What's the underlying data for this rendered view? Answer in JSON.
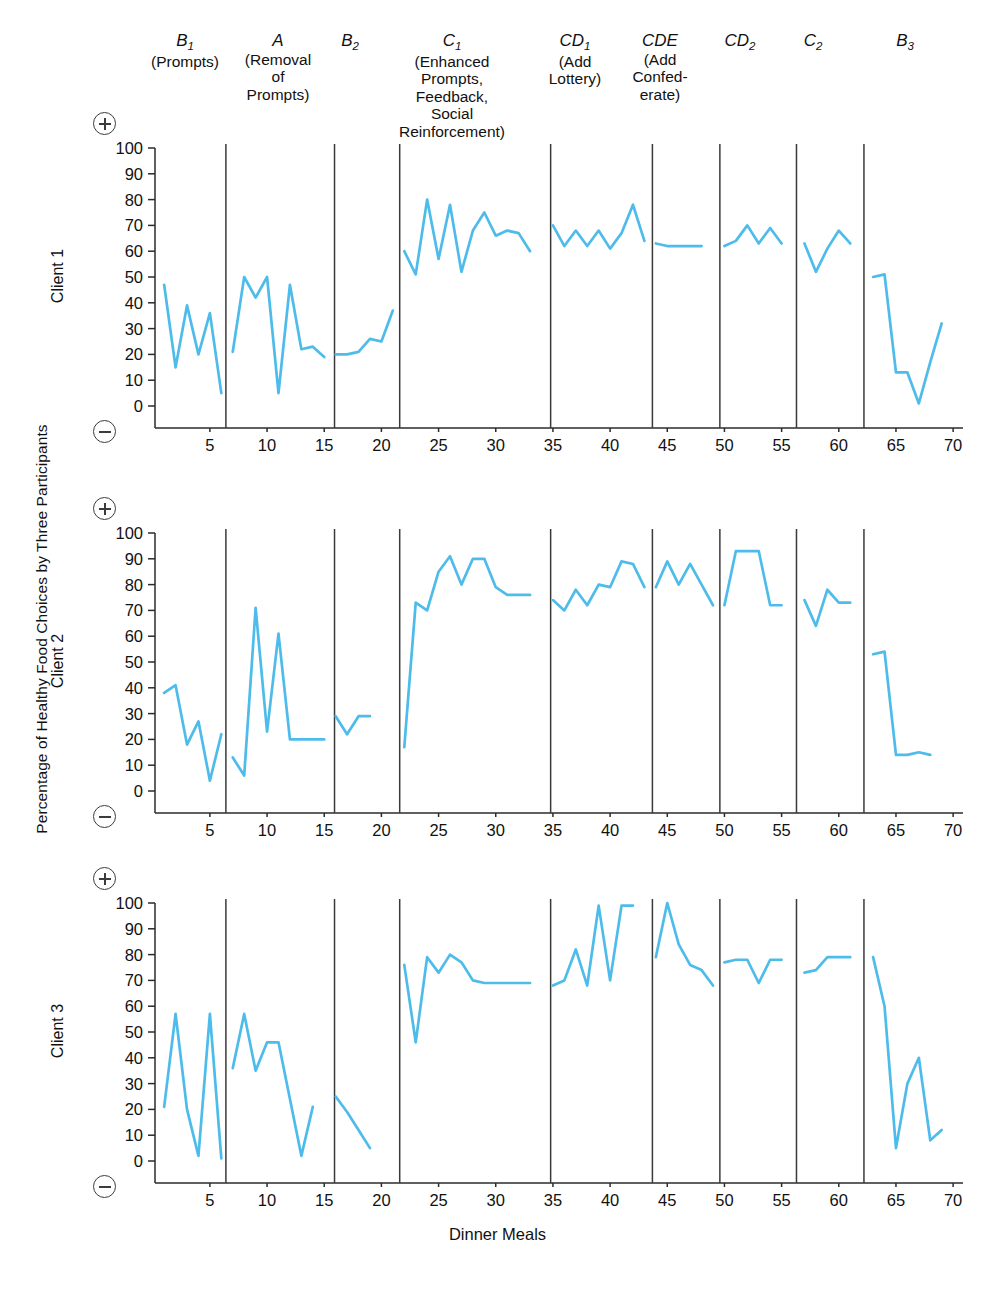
{
  "figure": {
    "ylabel": "Percentage of Healthy Food Choices by Three Participants",
    "xlabel": "Dinner Meals",
    "line_color": "#4EBCEA",
    "divider_color": "#3a3a3a",
    "axis_color": "#2b2b2b"
  },
  "phases": [
    {
      "code": "B",
      "sub": "1",
      "desc": "(Prompts)"
    },
    {
      "code": "A",
      "sub": "",
      "desc": "(Removal\nof\nPrompts)"
    },
    {
      "code": "B",
      "sub": "2",
      "desc": ""
    },
    {
      "code": "C",
      "sub": "1",
      "desc": "(Enhanced\nPrompts,\nFeedback,\nSocial\nReinforcement)"
    },
    {
      "code": "CD",
      "sub": "1",
      "desc": "(Add\nLottery)"
    },
    {
      "code": "CDE",
      "sub": "",
      "desc": "(Add\nConfed-\nerate)"
    },
    {
      "code": "CD",
      "sub": "2",
      "desc": ""
    },
    {
      "code": "C",
      "sub": "2",
      "desc": ""
    },
    {
      "code": "B",
      "sub": "3",
      "desc": ""
    }
  ],
  "phase_boundaries": [
    6.4,
    15.9,
    21.6,
    34.8,
    43.7,
    49.6,
    56.3,
    62.2
  ],
  "axes": {
    "ytick_labels": [
      "100",
      "90",
      "80",
      "70",
      "60",
      "50",
      "40",
      "30",
      "20",
      "10",
      "0"
    ],
    "ytick_values": [
      100,
      90,
      80,
      70,
      60,
      50,
      40,
      30,
      20,
      10,
      0
    ],
    "xtick_labels": [
      "5",
      "10",
      "15",
      "20",
      "25",
      "30",
      "35",
      "40",
      "45",
      "50",
      "55",
      "60",
      "65",
      "70"
    ],
    "xtick_values": [
      5,
      10,
      15,
      20,
      25,
      30,
      35,
      40,
      45,
      50,
      55,
      60,
      65,
      70
    ],
    "xlim": [
      0.2,
      70.6
    ],
    "ylim": [
      0,
      100
    ],
    "plus_symbol": "plus-in-circle",
    "minus_symbol": "minus-in-circle"
  },
  "panels": [
    {
      "label": "Client 1"
    },
    {
      "label": "Client 2"
    },
    {
      "label": "Client 3"
    }
  ],
  "chart_data": {
    "type": "line",
    "title": "",
    "xlabel": "Dinner Meals",
    "ylabel": "Percentage of Healthy Food Choices by Three Participants",
    "xlim": [
      0.2,
      70.6
    ],
    "ylim": [
      0,
      100
    ],
    "grid": false,
    "legend": "none",
    "annotations": [
      "B1 (Prompts)",
      "A (Removal of Prompts)",
      "B2",
      "C1 (Enhanced Prompts, Feedback, Social Reinforcement)",
      "CD1 (Add Lottery)",
      "CDE (Add Confederate)",
      "CD2",
      "C2",
      "B3"
    ],
    "series": [
      {
        "name": "Client 1",
        "segments": [
          {
            "phase": "B1",
            "x": [
              1,
              2,
              3,
              4,
              5,
              6
            ],
            "y": [
              47,
              15,
              39,
              20,
              36,
              5
            ]
          },
          {
            "phase": "A",
            "x": [
              7,
              8,
              9,
              10,
              11,
              12,
              13,
              14,
              15
            ],
            "y": [
              21,
              50,
              42,
              50,
              5,
              47,
              22,
              23,
              19
            ]
          },
          {
            "phase": "B2",
            "x": [
              16,
              17,
              18,
              19,
              20,
              21
            ],
            "y": [
              20,
              20,
              21,
              26,
              25,
              37
            ]
          },
          {
            "phase": "C1",
            "x": [
              22,
              23,
              24,
              25,
              26,
              27,
              28,
              29,
              30,
              31,
              32,
              33
            ],
            "y": [
              60,
              51,
              80,
              57,
              78,
              52,
              68,
              75,
              66,
              68,
              67,
              60
            ]
          },
          {
            "phase": "CD1",
            "x": [
              35,
              36,
              37,
              38,
              39,
              40,
              41,
              42,
              43
            ],
            "y": [
              70,
              62,
              68,
              62,
              68,
              61,
              67,
              78,
              64
            ]
          },
          {
            "phase": "CDE",
            "x": [
              44,
              45,
              46,
              47,
              48
            ],
            "y": [
              63,
              62,
              62,
              62,
              62
            ]
          },
          {
            "phase": "CD2",
            "x": [
              50,
              51,
              52,
              53,
              54,
              55
            ],
            "y": [
              62,
              64,
              70,
              63,
              69,
              63
            ]
          },
          {
            "phase": "C2",
            "x": [
              57,
              58,
              59,
              60,
              61
            ],
            "y": [
              63,
              52,
              61,
              68,
              63
            ]
          },
          {
            "phase": "B3",
            "x": [
              63,
              64,
              65,
              66,
              67,
              68,
              69
            ],
            "y": [
              50,
              51,
              13,
              13,
              1,
              17,
              32
            ]
          }
        ]
      },
      {
        "name": "Client 2",
        "segments": [
          {
            "phase": "B1",
            "x": [
              1,
              2,
              3,
              4,
              5,
              6
            ],
            "y": [
              38,
              41,
              18,
              27,
              4,
              22
            ]
          },
          {
            "phase": "A",
            "x": [
              7,
              8,
              9,
              10,
              11,
              12,
              13,
              14,
              15
            ],
            "y": [
              13,
              6,
              71,
              23,
              61,
              20,
              20,
              20,
              20
            ]
          },
          {
            "phase": "B2",
            "x": [
              16,
              17,
              18,
              19
            ],
            "y": [
              29,
              22,
              29,
              29
            ]
          },
          {
            "phase": "C1",
            "x": [
              22,
              23,
              24,
              25,
              26,
              27,
              28,
              29,
              30,
              31,
              32,
              33
            ],
            "y": [
              17,
              73,
              70,
              85,
              91,
              80,
              90,
              90,
              79,
              76,
              76,
              76
            ]
          },
          {
            "phase": "CD1",
            "x": [
              35,
              36,
              37,
              38,
              39,
              40,
              41,
              42,
              43
            ],
            "y": [
              74,
              70,
              78,
              72,
              80,
              79,
              89,
              88,
              79
            ]
          },
          {
            "phase": "CDE",
            "x": [
              44,
              45,
              46,
              47,
              48,
              49
            ],
            "y": [
              79,
              89,
              80,
              88,
              80,
              72
            ]
          },
          {
            "phase": "CD2",
            "x": [
              50,
              51,
              52,
              53,
              54,
              55
            ],
            "y": [
              72,
              93,
              93,
              93,
              72,
              72
            ]
          },
          {
            "phase": "C2",
            "x": [
              57,
              58,
              59,
              60,
              61
            ],
            "y": [
              74,
              64,
              78,
              73,
              73
            ]
          },
          {
            "phase": "B3",
            "x": [
              63,
              64,
              65,
              66,
              67,
              68
            ],
            "y": [
              53,
              54,
              14,
              14,
              15,
              14
            ]
          }
        ]
      },
      {
        "name": "Client 3",
        "segments": [
          {
            "phase": "B1",
            "x": [
              1,
              2,
              3,
              4,
              5,
              6
            ],
            "y": [
              21,
              57,
              20,
              2,
              57,
              1
            ]
          },
          {
            "phase": "A",
            "x": [
              7,
              8,
              9,
              10,
              11,
              12,
              13,
              14
            ],
            "y": [
              36,
              57,
              35,
              46,
              46,
              24,
              2,
              21
            ]
          },
          {
            "phase": "B2",
            "x": [
              16,
              17,
              18,
              19
            ],
            "y": [
              25,
              19,
              12,
              5
            ]
          },
          {
            "phase": "C1",
            "x": [
              22,
              23,
              24,
              25,
              26,
              27,
              28,
              29,
              30,
              31,
              32,
              33
            ],
            "y": [
              76,
              46,
              79,
              73,
              80,
              77,
              70,
              69,
              69,
              69,
              69,
              69
            ]
          },
          {
            "phase": "CD1",
            "x": [
              35,
              36,
              37,
              38,
              39,
              40,
              41,
              42
            ],
            "y": [
              68,
              70,
              82,
              68,
              99,
              70,
              99,
              99
            ]
          },
          {
            "phase": "CDE",
            "x": [
              44,
              45,
              46,
              47,
              48,
              49
            ],
            "y": [
              79,
              100,
              84,
              76,
              74,
              68
            ]
          },
          {
            "phase": "CD2",
            "x": [
              50,
              51,
              52,
              53,
              54,
              55
            ],
            "y": [
              77,
              78,
              78,
              69,
              78,
              78
            ]
          },
          {
            "phase": "C2",
            "x": [
              57,
              58,
              59,
              60,
              61
            ],
            "y": [
              73,
              74,
              79,
              79,
              79
            ]
          },
          {
            "phase": "B3",
            "x": [
              63,
              64,
              65,
              66,
              67,
              68,
              69
            ],
            "y": [
              79,
              60,
              5,
              30,
              40,
              8,
              12
            ]
          }
        ]
      }
    ]
  }
}
